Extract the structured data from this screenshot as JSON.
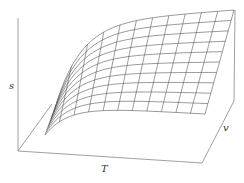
{
  "chart_data": {
    "type": "surface3d",
    "title": "",
    "axes": {
      "x": {
        "label": "T"
      },
      "y": {
        "label": "v"
      },
      "z": {
        "label": "s"
      }
    },
    "grid": false,
    "mesh": {
      "t_lines": 12,
      "v_lines": 11
    },
    "colors": {
      "line": "#555555",
      "axis": "#888888"
    }
  },
  "labels": {
    "s": "s",
    "T": "T",
    "v": "v"
  }
}
